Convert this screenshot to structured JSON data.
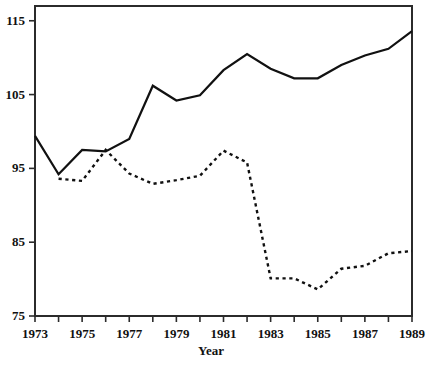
{
  "chart_data": {
    "type": "line",
    "title": "",
    "subtitle": "",
    "xlabel": "Year",
    "ylabel": "",
    "xlim": [
      1973,
      1989
    ],
    "ylim": [
      75,
      117
    ],
    "grid": false,
    "legend": "none",
    "axis_box": "full-rectangle-frame",
    "x": [
      1973,
      1974,
      1975,
      1976,
      1977,
      1978,
      1979,
      1980,
      1981,
      1982,
      1983,
      1984,
      1985,
      1986,
      1987,
      1988,
      1989
    ],
    "y_ticks": [
      75,
      85,
      95,
      105,
      115
    ],
    "y_tick_labels": [
      "75",
      "85",
      "95",
      "105",
      "115"
    ],
    "x_ticks": [
      1973,
      1974,
      1975,
      1976,
      1977,
      1978,
      1979,
      1980,
      1981,
      1982,
      1983,
      1984,
      1985,
      1986,
      1987,
      1988,
      1989
    ],
    "x_tick_labels": [
      "1973",
      "",
      "1975",
      "",
      "1977",
      "",
      "1979",
      "",
      "1981",
      "",
      "1983",
      "",
      "1985",
      "",
      "1987",
      "",
      "1989"
    ],
    "x_labeled_ticks": [
      1973,
      1975,
      1977,
      1979,
      1981,
      1983,
      1985,
      1987,
      1989
    ],
    "series": [
      {
        "name": "solid-series",
        "style": "solid",
        "color": "#111111",
        "values": [
          99.4,
          94.2,
          97.5,
          97.3,
          99.0,
          106.2,
          104.2,
          104.9,
          108.3,
          110.5,
          108.5,
          107.2,
          107.2,
          109.0,
          110.3,
          111.2,
          113.6
        ]
      },
      {
        "name": "dashed-series",
        "style": "dashed",
        "color": "#111111",
        "values": [
          null,
          93.6,
          93.3,
          97.5,
          94.3,
          92.9,
          93.4,
          94.0,
          97.4,
          95.8,
          80.1,
          80.1,
          78.6,
          81.4,
          81.8,
          83.5,
          83.8
        ]
      }
    ]
  },
  "axis": {
    "x_title": "Year"
  }
}
